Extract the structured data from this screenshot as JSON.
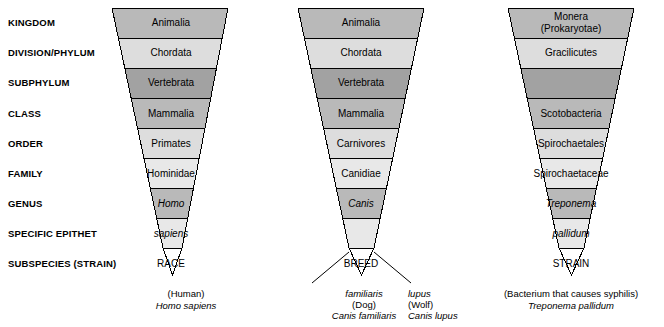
{
  "figure": {
    "type": "taxonomic-hierarchy-funnel-diagram",
    "colors": {
      "band_medium": "#b9b9b9",
      "band_light": "#dddddd",
      "band_dark": "#a2a2a2",
      "band_pale": "#e8e8e8",
      "outline": "#000000",
      "background": "#ffffff"
    }
  },
  "ranks": [
    {
      "label": "KINGDOM"
    },
    {
      "label": "DIVISION/PHYLUM"
    },
    {
      "label": "SUBPHYLUM"
    },
    {
      "label": "CLASS"
    },
    {
      "label": "ORDER"
    },
    {
      "label": "FAMILY"
    },
    {
      "label": "GENUS"
    },
    {
      "label": "SPECIFIC EPITHET"
    },
    {
      "label": "SUBSPECIES (STRAIN)"
    }
  ],
  "funnels": [
    {
      "id": "human",
      "bands": [
        {
          "text": "Animalia",
          "italic": false
        },
        {
          "text": "Chordata",
          "italic": false
        },
        {
          "text": "Vertebrata",
          "italic": false
        },
        {
          "text": "Mammalia",
          "italic": false
        },
        {
          "text": "Primates",
          "italic": false
        },
        {
          "text": "Hominidae",
          "italic": false
        },
        {
          "text": "Homo",
          "italic": true
        },
        {
          "text": "sapiens",
          "italic": true
        },
        {
          "text": "RACE",
          "italic": false
        }
      ],
      "captions": [
        {
          "line1": "(Human)",
          "line2": "Homo sapiens",
          "line1_italic": false,
          "line2_italic": true
        }
      ]
    },
    {
      "id": "dog-wolf",
      "bands": [
        {
          "text": "Animalia",
          "italic": false
        },
        {
          "text": "Chordata",
          "italic": false
        },
        {
          "text": "Vertebrata",
          "italic": false
        },
        {
          "text": "Mammalia",
          "italic": false
        },
        {
          "text": "Carnivores",
          "italic": false
        },
        {
          "text": "Canidiae",
          "italic": false
        },
        {
          "text": "Canis",
          "italic": true
        },
        {
          "text": "",
          "italic": false
        },
        {
          "text": "BREED",
          "italic": false
        }
      ],
      "captions": [
        {
          "line1": "familiaris",
          "line2": "(Dog)",
          "line3": "Canis familiaris",
          "line1_italic": true,
          "line2_italic": false,
          "line3_italic": true
        },
        {
          "line1": "lupus",
          "line2": "(Wolf)",
          "line3": "Canis lupus",
          "line1_italic": true,
          "line2_italic": false,
          "line3_italic": true
        }
      ]
    },
    {
      "id": "syphilis-bacterium",
      "bands": [
        {
          "text": "Monera",
          "text2": "(Prokaryotae)",
          "italic": false
        },
        {
          "text": "Gracilicutes",
          "italic": false
        },
        {
          "text": "",
          "italic": false
        },
        {
          "text": "Scotobacteria",
          "italic": false
        },
        {
          "text": "Spirochaetales",
          "italic": false
        },
        {
          "text": "Spirochaetaceae",
          "italic": false
        },
        {
          "text": "Treponema",
          "italic": true
        },
        {
          "text": "pallidum",
          "italic": true
        },
        {
          "text": "STRAIN",
          "italic": false
        }
      ],
      "captions": [
        {
          "line1": "(Bacterium that causes syphilis)",
          "line2": "Treponema pallidum",
          "line1_italic": false,
          "line2_italic": true
        }
      ]
    }
  ]
}
